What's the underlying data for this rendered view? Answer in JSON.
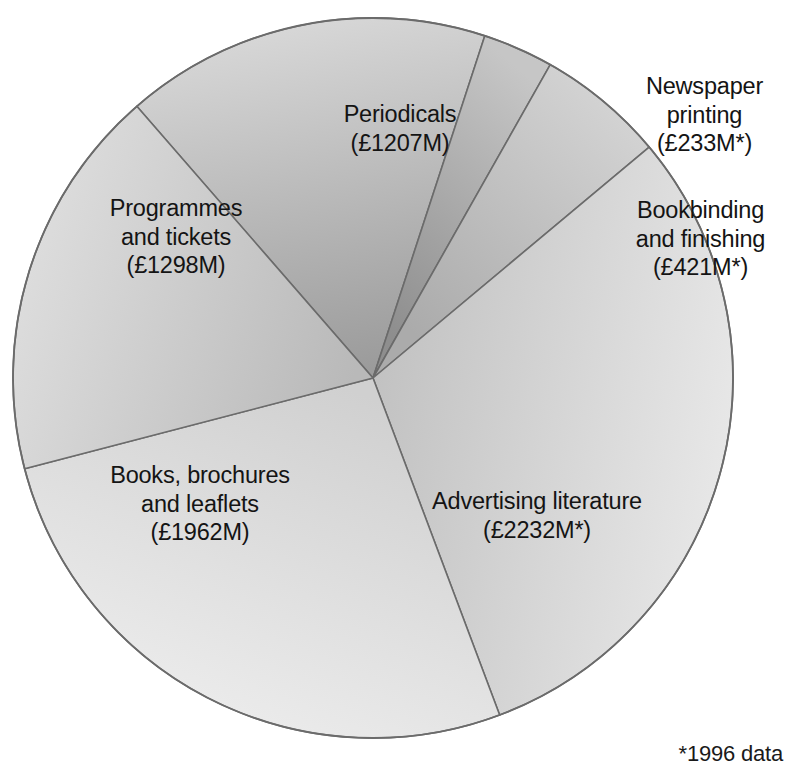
{
  "chart_data": {
    "type": "pie",
    "title": "UK printing market by sector",
    "title_visible": false,
    "unit": "£M",
    "currency_symbol": "£",
    "total": 7353,
    "footnote": "*1996 data",
    "legend_position": "none",
    "grid": false,
    "categories": [
      "Periodicals",
      "Newspaper printing",
      "Bookbinding and finishing",
      "Advertising literature",
      "Books, brochures and leaflets",
      "Programmes and tickets"
    ],
    "values": [
      1207,
      233,
      421,
      2232,
      1962,
      1298
    ],
    "labels": [
      "Periodicals\n(£1207M)",
      "Newspaper\nprinting\n(£233M*)",
      "Bookbinding\nand finishing\n(£421M*)",
      "Advertising literature\n(£2232M*)",
      "Books, brochures\nand leaflets\n(£1962M)",
      "Programmes\nand tickets\n(£1298M)"
    ],
    "slices": [
      {
        "name": "Periodicals",
        "value": 1207,
        "value_label": "£1207M",
        "name_lines": [
          "Periodicals"
        ],
        "estimated_footnote": false,
        "start_angle": -41.0,
        "end_angle": 18.1,
        "fill_light": "#d8d8d8",
        "fill_dark": "#9b9b9b"
      },
      {
        "name": "Newspaper printing",
        "value": 233,
        "value_label": "£233M*",
        "name_lines": [
          "Newspaper",
          "printing"
        ],
        "estimated_footnote": true,
        "start_angle": 18.1,
        "end_angle": 29.5,
        "fill_light": "#c6c6c6",
        "fill_dark": "#8e8e8e"
      },
      {
        "name": "Bookbinding and finishing",
        "value": 421,
        "value_label": "£421M*",
        "name_lines": [
          "Bookbinding",
          "and finishing"
        ],
        "estimated_footnote": true,
        "start_angle": 29.5,
        "end_angle": 50.1,
        "fill_light": "#d2d2d2",
        "fill_dark": "#ababab"
      },
      {
        "name": "Advertising literature",
        "value": 2232,
        "value_label": "£2232M*",
        "name_lines": [
          "Advertising literature"
        ],
        "estimated_footnote": true,
        "start_angle": 50.1,
        "end_angle": 159.4,
        "fill_light": "#e8e8e8",
        "fill_dark": "#c2c2c2"
      },
      {
        "name": "Books, brochures and leaflets",
        "value": 1962,
        "value_label": "£1962M",
        "name_lines": [
          "Books, brochures",
          "and leaflets"
        ],
        "estimated_footnote": false,
        "start_angle": 159.4,
        "end_angle": 255.4,
        "fill_light": "#ededed",
        "fill_dark": "#d0d0d0"
      },
      {
        "name": "Programmes and tickets",
        "value": 1298,
        "value_label": "£1298M",
        "name_lines": [
          "Programmes",
          "and tickets"
        ],
        "estimated_footnote": false,
        "start_angle": 255.4,
        "end_angle": 319.0,
        "fill_light": "#dedede",
        "fill_dark": "#b9b9b9"
      }
    ],
    "geometry": {
      "center_x": 373,
      "center_y": 378,
      "radius": 360
    },
    "colors": {
      "outline": "#6b6b6b",
      "divider": "#6b6b6b",
      "text": "#141414",
      "background": "#ffffff"
    }
  },
  "labels": {
    "periodicals": "Periodicals\n(£1207M)",
    "newspaper": "Newspaper\nprinting\n(£233M*)",
    "bookbinding": "Bookbinding\nand finishing\n(£421M*)",
    "advertising": "Advertising literature\n(£2232M*)",
    "books": "Books, brochures\nand leaflets\n(£1962M)",
    "programmes": "Programmes\nand tickets\n(£1298M)"
  },
  "footnote": "*1996 data"
}
